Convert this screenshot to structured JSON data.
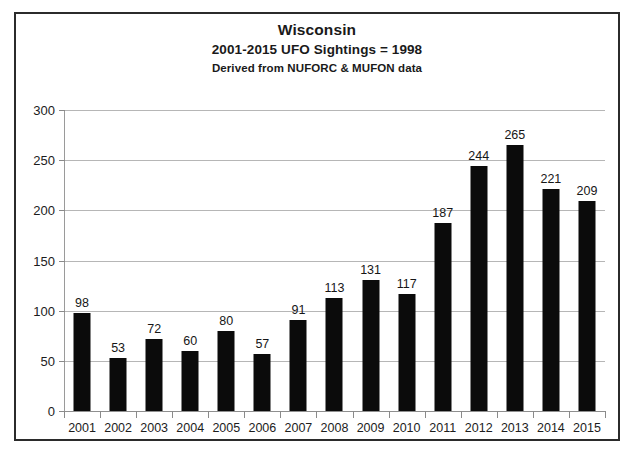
{
  "chart_data": {
    "type": "bar",
    "title": "Wisconsin",
    "subtitle": "2001-2015 UFO Sightings = 1998",
    "source_note": "Derived from NUFORC & MUFON data",
    "xlabel": "",
    "ylabel": "",
    "categories": [
      "2001",
      "2002",
      "2003",
      "2004",
      "2005",
      "2006",
      "2007",
      "2008",
      "2009",
      "2010",
      "2011",
      "2012",
      "2013",
      "2014",
      "2015"
    ],
    "values": [
      98,
      53,
      72,
      60,
      80,
      57,
      91,
      113,
      131,
      117,
      187,
      244,
      265,
      221,
      209
    ],
    "value_labels": [
      "98",
      "53",
      "72",
      "60",
      "80",
      "57",
      "91",
      "113",
      "131",
      "117",
      "187",
      "244",
      "265",
      "221",
      "209"
    ],
    "ylim": [
      0,
      300
    ],
    "ytick_labels": [
      "0",
      "50",
      "100",
      "150",
      "200",
      "250",
      "300"
    ],
    "ytick_values": [
      0,
      50,
      100,
      150,
      200,
      250,
      300
    ],
    "grid": "horizontal",
    "legend": "none",
    "series_color": "#0b0b0b",
    "gridline_color": "#b6b6b6",
    "frame_color": "#2b2b2b",
    "total": 1998
  }
}
